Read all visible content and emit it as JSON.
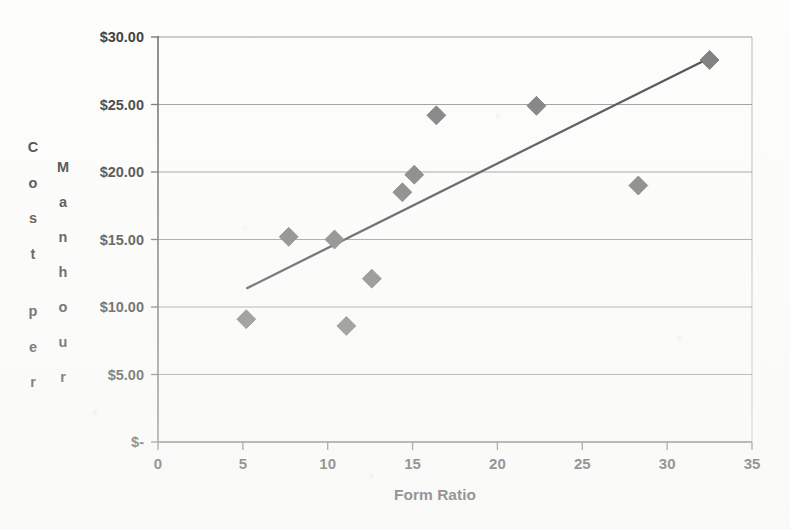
{
  "chart_data": {
    "type": "scatter",
    "title": "",
    "xlabel": "Form Ratio",
    "ylabel": "Cost per Manhour",
    "ylabel_column_1": "Cost per",
    "ylabel_column_2": "Manhour",
    "xlim": [
      0,
      35
    ],
    "ylim": [
      0,
      30
    ],
    "grid": "horizontal",
    "legend": "none",
    "x_ticks": [
      "0",
      "5",
      "10",
      "15",
      "20",
      "25",
      "30",
      "35"
    ],
    "x_tick_values": [
      0,
      5,
      10,
      15,
      20,
      25,
      30,
      35
    ],
    "y_ticks": [
      "$-",
      "$5.00",
      "$10.00",
      "$15.00",
      "$20.00",
      "$25.00",
      "$30.00"
    ],
    "y_tick_values": [
      0,
      5,
      10,
      15,
      20,
      25,
      30
    ],
    "series": [
      {
        "name": "Cost per Manhour vs Form Ratio",
        "marker": "diamond",
        "color": "#7b7b7b",
        "points": [
          {
            "x": 5.2,
            "y": 9.1
          },
          {
            "x": 7.7,
            "y": 15.2
          },
          {
            "x": 10.4,
            "y": 15.0
          },
          {
            "x": 11.1,
            "y": 8.6
          },
          {
            "x": 12.6,
            "y": 12.1
          },
          {
            "x": 14.4,
            "y": 18.5
          },
          {
            "x": 15.1,
            "y": 19.8
          },
          {
            "x": 16.4,
            "y": 24.2
          },
          {
            "x": 22.3,
            "y": 24.9
          },
          {
            "x": 28.3,
            "y": 19.0
          },
          {
            "x": 32.5,
            "y": 28.3
          }
        ]
      }
    ],
    "trendline": {
      "name": "linear-trendline",
      "color": "#4a4a52",
      "x_start": 5.25,
      "y_start": 11.4,
      "x_end": 32.5,
      "y_end": 28.45
    },
    "axis_color": "#6f6f6f",
    "gridline_color": "#8a8a8a",
    "background": "#fdfdfc"
  }
}
